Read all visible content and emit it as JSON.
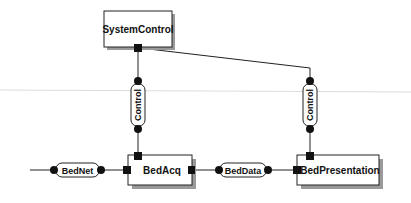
{
  "diagram": {
    "components": [
      {
        "id": "system-control",
        "label": "SystemControl"
      },
      {
        "id": "bed-acq",
        "label": "BedAcq"
      },
      {
        "id": "bed-presentation",
        "label": "BedPresentation"
      }
    ],
    "connectors": [
      {
        "id": "control-left",
        "label": "Control"
      },
      {
        "id": "control-right",
        "label": "Control"
      },
      {
        "id": "bed-net",
        "label": "BedNet"
      },
      {
        "id": "bed-data",
        "label": "BedData"
      }
    ]
  },
  "colors": {
    "line": "#222222",
    "shadow": "#9a9a9a",
    "guide": "#d8d8d8"
  }
}
